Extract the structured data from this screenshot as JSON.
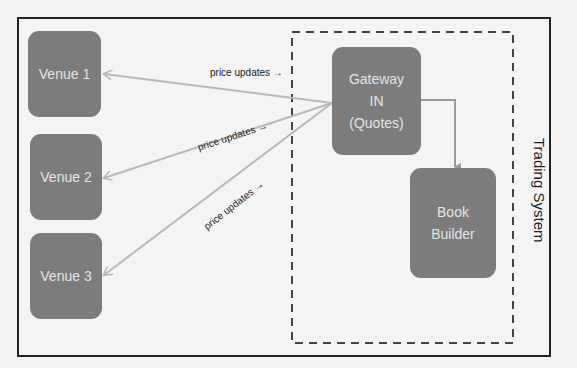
{
  "diagram": {
    "venues": [
      {
        "label": "Venue 1"
      },
      {
        "label": "Venue 2"
      },
      {
        "label": "Venue 3"
      }
    ],
    "gateway": {
      "line1": "Gateway",
      "line2": "IN",
      "line3": "(Quotes)"
    },
    "book_builder": {
      "line1": "Book",
      "line2": "Builder"
    },
    "edges": [
      {
        "label": "price updates →"
      },
      {
        "label": "price updates →"
      },
      {
        "label": "price updates →"
      }
    ],
    "boundary_label": "Trading System",
    "colors": {
      "node_fill": "#7c7c7c",
      "node_text": "#e4e4e4",
      "arrow": "#b8b8b8",
      "dashed": "#444444"
    }
  }
}
